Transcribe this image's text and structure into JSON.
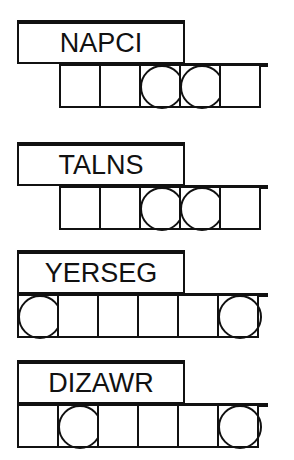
{
  "puzzles": [
    {
      "scrambled": "NAPCI",
      "cells": 5,
      "circled": [
        2,
        3
      ]
    },
    {
      "scrambled": "TALNS",
      "cells": 5,
      "circled": [
        2,
        3
      ]
    },
    {
      "scrambled": "YERSEG",
      "cells": 6,
      "circled": [
        0,
        5
      ]
    },
    {
      "scrambled": "DIZAWR",
      "cells": 6,
      "circled": [
        1,
        5
      ]
    }
  ]
}
